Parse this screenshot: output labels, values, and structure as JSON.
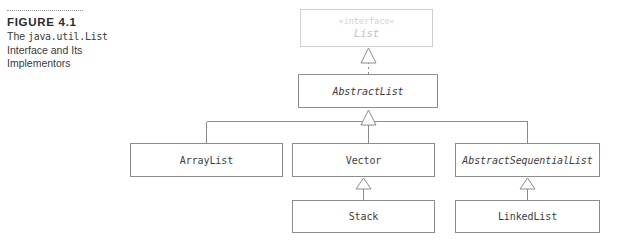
{
  "figure": {
    "rule": "dotted-rule",
    "number": "FIGURE 4.1",
    "title_prefix": "The ",
    "title_mono": "java.util.List",
    "title_rest_line1": "Interface and Its",
    "title_rest_line2": "Implementors"
  },
  "diagram": {
    "type": "uml-class-diagram",
    "colors": {
      "box_border": "#8c8c8c",
      "faded_border": "#cfcfcf",
      "text": "#3d3d3d",
      "faded_text": "#c2c2c2",
      "connector": "#8c8c8c",
      "background": "#ffffff"
    },
    "nodes": [
      {
        "id": "list",
        "name": "List",
        "stereotype": "«interface»",
        "kind": "interface",
        "italic": true,
        "faded": true
      },
      {
        "id": "abstractlist",
        "name": "AbstractList",
        "kind": "abstract-class",
        "italic": true,
        "faded": false
      },
      {
        "id": "arraylist",
        "name": "ArrayList",
        "kind": "class",
        "italic": false,
        "faded": false
      },
      {
        "id": "vector",
        "name": "Vector",
        "kind": "class",
        "italic": false,
        "faded": false
      },
      {
        "id": "abstractsequentiallist",
        "name": "AbstractSequentialList",
        "kind": "abstract-class",
        "italic": true,
        "faded": false
      },
      {
        "id": "stack",
        "name": "Stack",
        "kind": "class",
        "italic": false,
        "faded": false
      },
      {
        "id": "linkedlist",
        "name": "LinkedList",
        "kind": "class",
        "italic": false,
        "faded": false
      }
    ],
    "edges": [
      {
        "from": "abstractlist",
        "to": "list",
        "relation": "realization",
        "line": "dashed",
        "arrow": "hollow-triangle"
      },
      {
        "from": "arraylist",
        "to": "abstractlist",
        "relation": "generalization",
        "line": "solid",
        "arrow": "hollow-triangle"
      },
      {
        "from": "vector",
        "to": "abstractlist",
        "relation": "generalization",
        "line": "solid",
        "arrow": "hollow-triangle"
      },
      {
        "from": "abstractsequentiallist",
        "to": "abstractlist",
        "relation": "generalization",
        "line": "solid",
        "arrow": "hollow-triangle"
      },
      {
        "from": "stack",
        "to": "vector",
        "relation": "generalization",
        "line": "solid",
        "arrow": "hollow-triangle"
      },
      {
        "from": "linkedlist",
        "to": "abstractsequentiallist",
        "relation": "generalization",
        "line": "solid",
        "arrow": "hollow-triangle"
      }
    ]
  }
}
